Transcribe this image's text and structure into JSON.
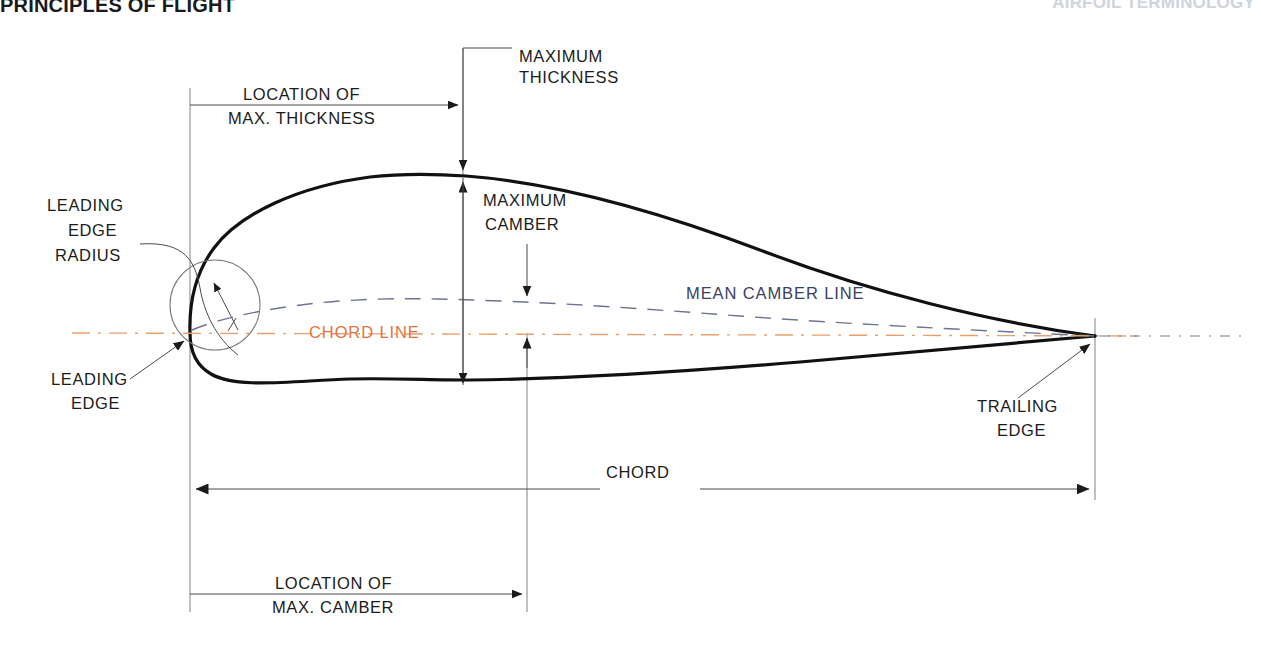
{
  "header": {
    "left_title": "PRINCIPLES OF FLIGHT",
    "right_title": "AIRFOIL TERMINOLOGY"
  },
  "diagram": {
    "labels": {
      "maximum_thickness": {
        "line1": "MAXIMUM",
        "line2": "THICKNESS"
      },
      "location_of_max_thickness": {
        "line1": "LOCATION OF",
        "line2": "MAX. THICKNESS"
      },
      "leading_edge_radius": {
        "line1": "LEADING",
        "line2": "EDGE",
        "line3": "RADIUS"
      },
      "leading_edge": {
        "line1": "LEADING",
        "line2": "EDGE"
      },
      "maximum_camber": {
        "line1": "MAXIMUM",
        "line2": "CAMBER"
      },
      "mean_camber_line": {
        "text": "MEAN  CAMBER  LINE"
      },
      "chord_line": {
        "text": "CHORD  LINE"
      },
      "trailing_edge": {
        "line1": "TRAILING",
        "line2": "EDGE"
      },
      "chord": {
        "text": "CHORD"
      },
      "location_of_max_camber": {
        "line1": "LOCATION OF",
        "line2": "MAX. CAMBER"
      }
    },
    "colors": {
      "chord_line": "#e2733f",
      "mean_camber_line": "#3b3f63",
      "airfoil_outline": "#111111",
      "dimension_line": "#4a4a4a",
      "background": "#ffffff"
    },
    "geometry": {
      "leading_edge_x": 190,
      "trailing_edge_x": 1095,
      "chord_line_y": 333,
      "max_thickness_x": 463,
      "max_camber_x": 527,
      "upper_surface_peak_y": 175,
      "lower_surface_y_at_max_thickness": 380,
      "mean_camber_peak_y": 300,
      "leading_edge_radius_center": [
        215,
        305
      ],
      "leading_edge_radius": 45
    }
  }
}
